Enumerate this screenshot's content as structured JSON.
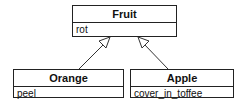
{
  "diagram": {
    "type": "uml-class-inheritance",
    "classes": [
      {
        "id": "fruit",
        "name": "Fruit",
        "attributes": [
          "rot"
        ]
      },
      {
        "id": "orange",
        "name": "Orange",
        "attributes": [
          "peel"
        ]
      },
      {
        "id": "apple",
        "name": "Apple",
        "attributes": [
          "cover_in_toffee"
        ]
      }
    ],
    "relations": [
      {
        "from": "Orange",
        "to": "Fruit",
        "kind": "generalization"
      },
      {
        "from": "Apple",
        "to": "Fruit",
        "kind": "generalization"
      }
    ]
  }
}
